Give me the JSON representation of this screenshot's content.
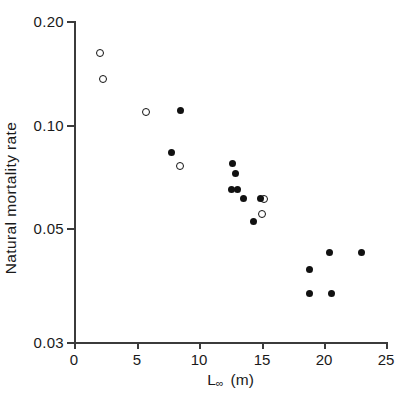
{
  "chart_data": {
    "type": "scatter",
    "title": "",
    "xlabel": "L∞  (m)",
    "ylabel": "Natural mortality rate",
    "xscale": "linear",
    "yscale": "log",
    "xlim": [
      0,
      25
    ],
    "ylim": [
      0.03,
      0.2
    ],
    "grid": false,
    "legend": "none",
    "x_ticks": [
      0,
      5,
      10,
      15,
      20,
      25
    ],
    "x_tick_labels": [
      "0",
      "5",
      "10",
      "15",
      "20",
      "25"
    ],
    "y_ticks": [
      0.03,
      0.05,
      0.1,
      0.2
    ],
    "y_tick_labels": [
      "0.03",
      "0.05",
      "0.10",
      "0.20"
    ],
    "series": [
      {
        "name": "open-circles",
        "marker": "open circle",
        "points": [
          {
            "x": 2.1,
            "y": 0.166
          },
          {
            "x": 2.3,
            "y": 0.142
          },
          {
            "x": 5.8,
            "y": 0.117
          },
          {
            "x": 8.5,
            "y": 0.085
          },
          {
            "x": 15.2,
            "y": 0.07
          },
          {
            "x": 15.1,
            "y": 0.064
          }
        ]
      },
      {
        "name": "filled-circles",
        "marker": "filled circle",
        "points": [
          {
            "x": 8.5,
            "y": 0.118
          },
          {
            "x": 7.8,
            "y": 0.092
          },
          {
            "x": 12.7,
            "y": 0.086
          },
          {
            "x": 12.9,
            "y": 0.081
          },
          {
            "x": 12.6,
            "y": 0.074
          },
          {
            "x": 13.1,
            "y": 0.074
          },
          {
            "x": 13.6,
            "y": 0.07
          },
          {
            "x": 14.9,
            "y": 0.07
          },
          {
            "x": 14.4,
            "y": 0.061
          },
          {
            "x": 18.9,
            "y": 0.046
          },
          {
            "x": 20.5,
            "y": 0.051
          },
          {
            "x": 23.0,
            "y": 0.051
          },
          {
            "x": 18.9,
            "y": 0.04
          },
          {
            "x": 20.6,
            "y": 0.04
          }
        ]
      }
    ],
    "colors": {
      "marker": "#111111",
      "axis": "#3b3b3b",
      "background": "#ffffff"
    }
  },
  "axis_title_parts": {
    "x_symbol": "L",
    "x_subscript": "∞",
    "x_units": "(m)"
  }
}
